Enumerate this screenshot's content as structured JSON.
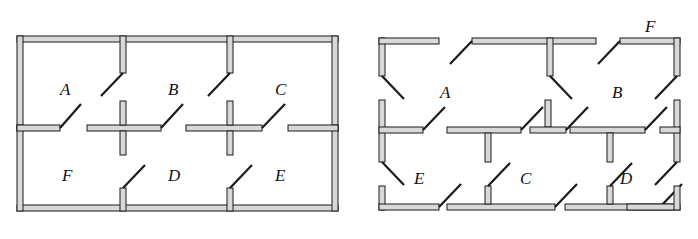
{
  "figure": {
    "type": "floor-plan-decomposition",
    "background_color": "#ffffff",
    "wall_fill_color": "#d8d8d8",
    "wall_stroke_color": "#1a1a1a",
    "door_stroke_color": "#1a1a1a",
    "panels": [
      {
        "id": "assembled-plan",
        "name": "assembled floor plan",
        "room_labels": [
          "A",
          "B",
          "C",
          "F",
          "D",
          "E"
        ]
      },
      {
        "id": "exploded-plan",
        "name": "exploded wall pieces",
        "room_labels": [
          "F",
          "A",
          "B",
          "E",
          "C",
          "D"
        ]
      }
    ]
  },
  "left_plan": {
    "labels": [
      {
        "text": "A",
        "x": 67,
        "y": 88
      },
      {
        "text": "B",
        "x": 174,
        "y": 88
      },
      {
        "text": "C",
        "x": 281,
        "y": 88
      },
      {
        "text": "F",
        "x": 67,
        "y": 174
      },
      {
        "text": "D",
        "x": 174,
        "y": 174
      },
      {
        "text": "E",
        "x": 281,
        "y": 174
      }
    ]
  },
  "right_plan": {
    "labels": [
      {
        "text": "F",
        "x": 650,
        "y": 27
      },
      {
        "text": "A",
        "x": 444,
        "y": 92
      },
      {
        "text": "B",
        "x": 617,
        "y": 92
      },
      {
        "text": "E",
        "x": 419,
        "y": 177
      },
      {
        "text": "C",
        "x": 525,
        "y": 177
      },
      {
        "text": "D",
        "x": 625,
        "y": 177
      }
    ]
  }
}
